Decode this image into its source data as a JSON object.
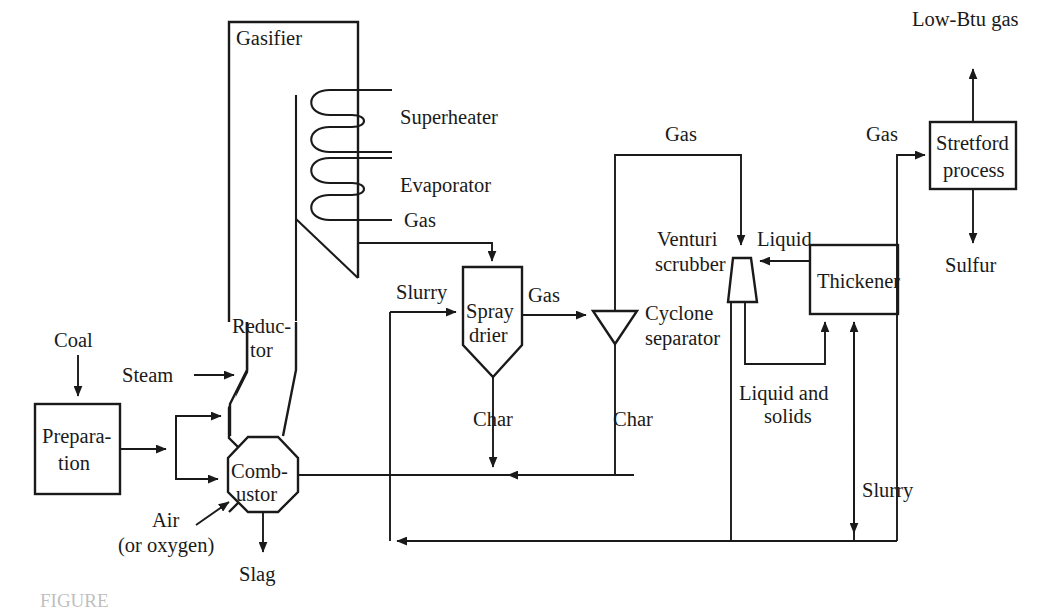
{
  "figure": {
    "type": "process-flow-diagram",
    "caption_partial": "FIGURE"
  },
  "units": [
    {
      "id": "gasifier",
      "label": "Gasifier",
      "shape": "open-rectangle"
    },
    {
      "id": "superheater",
      "label": "Superheater",
      "shape": "coil"
    },
    {
      "id": "evaporator",
      "label": "Evaporator",
      "shape": "coil"
    },
    {
      "id": "reductor",
      "label_line1": "Reduc-",
      "label_line2": "tor",
      "shape": "vessel-upper"
    },
    {
      "id": "combustor",
      "label_line1": "Comb-",
      "label_line2": "ustor",
      "shape": "octagon"
    },
    {
      "id": "preparation",
      "label_line1": "Prepara-",
      "label_line2": "tion",
      "shape": "rectangle"
    },
    {
      "id": "spray-drier",
      "label_line1": "Spray",
      "label_line2": "drier",
      "shape": "cone-bottom-vessel"
    },
    {
      "id": "cyclone-separator",
      "label_line1": "Cyclone",
      "label_line2": "separator",
      "shape": "down-triangle"
    },
    {
      "id": "venturi-scrubber",
      "label_line1": "Venturi",
      "label_line2": "scrubber",
      "shape": "venturi"
    },
    {
      "id": "thickener",
      "label": "Thickener",
      "shape": "rectangle"
    },
    {
      "id": "stretford",
      "label_line1": "Stretford",
      "label_line2": "process",
      "shape": "rectangle"
    }
  ],
  "streams": [
    {
      "id": "coal",
      "label": "Coal"
    },
    {
      "id": "steam",
      "label": "Steam"
    },
    {
      "id": "air",
      "label_line1": "Air",
      "label_line2": "(or oxygen)"
    },
    {
      "id": "slag",
      "label": "Slag"
    },
    {
      "id": "gas-from-gasifier",
      "label": "Gas"
    },
    {
      "id": "slurry-to-drier",
      "label": "Slurry"
    },
    {
      "id": "gas-drier-out",
      "label": "Gas"
    },
    {
      "id": "char-drier",
      "label": "Char"
    },
    {
      "id": "char-cyclone",
      "label": "Char"
    },
    {
      "id": "gas-to-scrubber",
      "label": "Gas"
    },
    {
      "id": "liquid",
      "label": "Liquid"
    },
    {
      "id": "liquid-and-solids",
      "label_line1": "Liquid and",
      "label_line2": "solids"
    },
    {
      "id": "gas-to-stretford",
      "label": "Gas"
    },
    {
      "id": "low-btu-gas",
      "label": "Low-Btu gas"
    },
    {
      "id": "sulfur",
      "label": "Sulfur"
    },
    {
      "id": "slurry-recycle",
      "label": "Slurry"
    }
  ],
  "colors": {
    "line": "#1a1a1a",
    "background": "#ffffff"
  }
}
